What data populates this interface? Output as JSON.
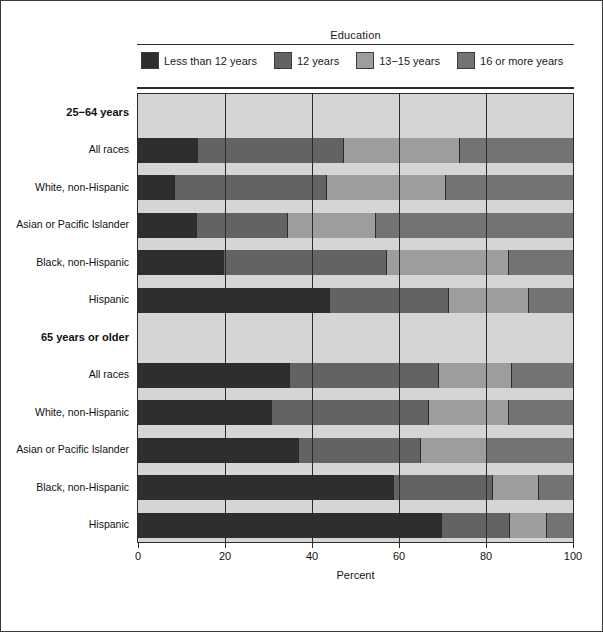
{
  "legend": {
    "title": "Education",
    "items": [
      {
        "label": "Less than 12 years",
        "color": "#2e2e2e"
      },
      {
        "label": "12 years",
        "color": "#636363"
      },
      {
        "label": "13−15 years",
        "color": "#9d9d9d"
      },
      {
        "label": "16 or more years",
        "color": "#737373"
      }
    ]
  },
  "axis": {
    "xlabel": "Percent",
    "ticks": [
      "0",
      "20",
      "40",
      "60",
      "80",
      "100"
    ],
    "xlim": [
      0,
      100
    ]
  },
  "groups": [
    {
      "label": "25−64 years"
    },
    {
      "label": "65 years or older"
    }
  ],
  "chart_data": {
    "type": "bar",
    "orientation": "horizontal",
    "stacked": true,
    "title": "",
    "xlabel": "Percent",
    "ylabel": "",
    "xlim": [
      0,
      100
    ],
    "grid": false,
    "legend_position": "top",
    "legend_title": "Education",
    "series": [
      {
        "name": "Less than 12 years",
        "color": "#2e2e2e",
        "values": [
          13.7,
          8.6,
          13.5,
          19.8,
          44.1,
          34.9,
          30.9,
          37.0,
          58.8,
          69.9
        ]
      },
      {
        "name": "12 years",
        "color": "#636363",
        "values": [
          33.6,
          34.9,
          21.0,
          37.5,
          27.3,
          34.4,
          36.1,
          28.1,
          22.9,
          15.7
        ]
      },
      {
        "name": "13−15 years",
        "color": "#9d9d9d",
        "values": [
          26.8,
          27.4,
          20.3,
          27.9,
          18.6,
          16.6,
          18.4,
          15.1,
          10.6,
          8.4
        ]
      },
      {
        "name": "16 or more years",
        "color": "#737373",
        "values": [
          25.9,
          29.1,
          45.2,
          14.8,
          10.0,
          14.1,
          14.6,
          19.8,
          7.7,
          6.0
        ]
      }
    ],
    "categories": [
      {
        "label": "All races",
        "group": "25−64 years"
      },
      {
        "label": "White, non-Hispanic",
        "group": "25−64 years"
      },
      {
        "label": "Asian or Pacific Islander",
        "group": "25−64 years"
      },
      {
        "label": "Black, non-Hispanic",
        "group": "25−64 years"
      },
      {
        "label": "Hispanic",
        "group": "25−64 years"
      },
      {
        "label": "All races",
        "group": "65 years or older"
      },
      {
        "label": "White, non-Hispanic",
        "group": "65 years or older"
      },
      {
        "label": "Asian or Pacific Islander",
        "group": "65 years or older"
      },
      {
        "label": "Black, non-Hispanic",
        "group": "65 years or older"
      },
      {
        "label": "Hispanic",
        "group": "65 years or older"
      }
    ],
    "cumulative_breaks": [
      [
        13.7,
        47.3,
        74.1
      ],
      [
        8.6,
        43.5,
        70.9
      ],
      [
        13.5,
        34.5,
        54.8
      ],
      [
        19.8,
        57.3,
        85.2
      ],
      [
        44.1,
        71.4,
        90.0
      ],
      [
        34.9,
        69.3,
        85.9
      ],
      [
        30.9,
        67.0,
        85.4
      ],
      [
        37.0,
        65.1,
        80.2
      ],
      [
        58.8,
        81.7,
        92.3
      ],
      [
        69.9,
        85.6,
        94.0
      ]
    ]
  }
}
